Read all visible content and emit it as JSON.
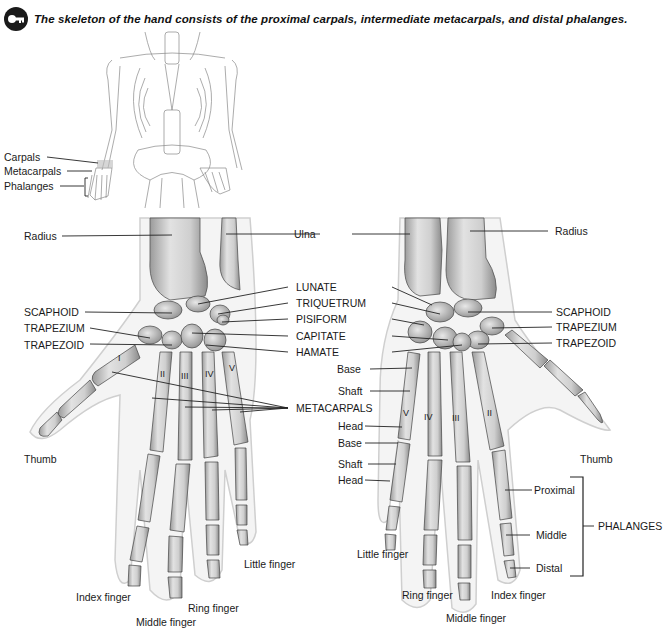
{
  "caption": {
    "icon": "key-icon",
    "text": "The skeleton of the hand consists of the proximal carpals, intermediate metacarpals, and distal phalanges."
  },
  "overview": {
    "labels": [
      "Carpals",
      "Metacarpals",
      "Phalanges"
    ]
  },
  "left_hand": {
    "top_labels": {
      "radius": "Radius",
      "ulna": "Ulna"
    },
    "carpal_labels_left": [
      "SCAPHOID",
      "TRAPEZIUM",
      "TRAPEZOID"
    ],
    "center_labels": [
      "LUNATE",
      "TRIQUETRUM",
      "PISIFORM",
      "CAPITATE",
      "HAMATE",
      "METACARPALS"
    ],
    "numerals": [
      "I",
      "II",
      "III",
      "IV",
      "V"
    ],
    "finger_labels": {
      "thumb": "Thumb",
      "index": "Index finger",
      "middle": "Middle finger",
      "ring": "Ring finger",
      "little": "Little finger"
    }
  },
  "right_hand": {
    "top_labels": {
      "radius": "Radius"
    },
    "carpal_labels_right": [
      "SCAPHOID",
      "TRAPEZIUM",
      "TRAPEZOID"
    ],
    "part_labels": [
      "Base",
      "Shaft",
      "Head",
      "Base",
      "Shaft",
      "Head"
    ],
    "numerals": [
      "V",
      "IV",
      "III",
      "II"
    ],
    "phalanx_labels": [
      "Proximal",
      "Middle",
      "Distal"
    ],
    "phalanges_group": "PHALANGES",
    "finger_labels": {
      "thumb": "Thumb",
      "index": "Index finger",
      "middle": "Middle finger",
      "ring": "Ring finger",
      "little": "Little finger"
    }
  }
}
